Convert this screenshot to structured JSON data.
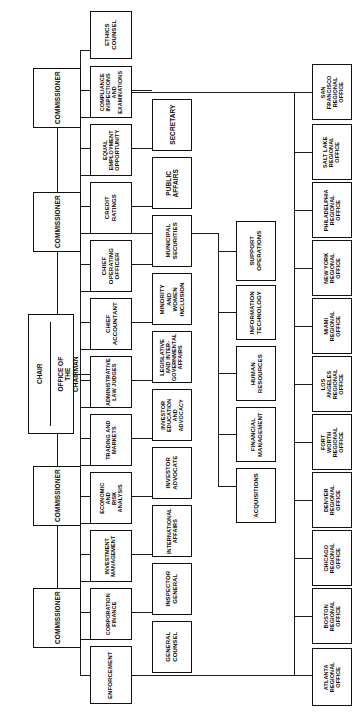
{
  "chart": {
    "orientation": "rotated-90",
    "line_color": "#1a1a1a",
    "box_border_color": "#111111",
    "background": "#ffffff"
  },
  "commission": {
    "chair": {
      "title": "CHAIR",
      "office": "OFFICE OF THE\nCHAIRMAN"
    },
    "members": [
      {
        "label": "COMMISSIONER"
      },
      {
        "label": "COMMISSIONER"
      },
      {
        "label": "COMMISSIONER"
      },
      {
        "label": "COMMISSIONER"
      }
    ]
  },
  "ethics": {
    "label": "ETHICS\nCOUNSEL"
  },
  "divisions_column": [
    {
      "label": "COMPLIANCE\nINSPECTIONS\nAND\nEXAMINATIONS"
    },
    {
      "label": "EQUAL\nEMPLOYMENT\nOPPORTUNITY"
    },
    {
      "label": "CREDIT\nRATINGS"
    },
    {
      "label": "CHIEF\nOPERATING\nOFFICER"
    },
    {
      "label": "CHIEF\nACCOUNTANT"
    },
    {
      "label": "ADMINISTRATIVE\nLAW JUDGES"
    },
    {
      "label": "TRADING AND\nMARKETS"
    },
    {
      "label": "ECONOMIC AND\nRISK ANALYSIS"
    },
    {
      "label": "INVESTMENT\nMANAGEMENT"
    },
    {
      "label": "CORPORATION\nFINANCE"
    },
    {
      "label": "ENFORCEMENT"
    }
  ],
  "offices_column": [
    {
      "label": "SECRETARY"
    },
    {
      "label": "PUBLIC\nAFFAIRS"
    },
    {
      "label": "MUNICIPAL\nSECURITIES"
    },
    {
      "label": "MINORITY\nAND WOMEN\nINCLUSION"
    },
    {
      "label": "LEGISLATIVE\nAND INTER-\nGOVERNMENTAL\nAFFAIRS"
    },
    {
      "label": "INVESTOR\nEDUCATION\nAND ADVOCACY"
    },
    {
      "label": "INVESTOR\nADVOCATE"
    },
    {
      "label": "INTERNATIONAL\nAFFAIRS"
    },
    {
      "label": "INSPECTOR\nGENERAL"
    },
    {
      "label": "GENERAL\nCOUNSEL"
    }
  ],
  "operations_column": [
    {
      "label": "SUPPORT\nOPERATIONS"
    },
    {
      "label": "INFORMATION\nTECHNOLOGY"
    },
    {
      "label": "HUMAN\nRESOURCES"
    },
    {
      "label": "FINANCIAL\nMANAGEMENT"
    },
    {
      "label": "ACQUISITIONS"
    }
  ],
  "regional_offices": [
    {
      "label": "SAN FRANCISCO\nREGIONAL\nOFFICE"
    },
    {
      "label": "SALT LAKE\nREGIONAL\nOFFICE"
    },
    {
      "label": "PHILADELPHIA\nREGIONAL\nOFFICE"
    },
    {
      "label": "NEW YORK\nREGIONAL\nOFFICE"
    },
    {
      "label": "MIAMI\nREGIONAL\nOFFICE"
    },
    {
      "label": "LOS ANGELES\nREGIONAL\nOFFICE"
    },
    {
      "label": "FORT WORTH\nREGIONAL\nOFFICE"
    },
    {
      "label": "DENVER\nREGIONAL\nOFFICE"
    },
    {
      "label": "CHICAGO\nREGIONAL\nOFFICE"
    },
    {
      "label": "BOSTON\nREGIONAL\nOFFICE"
    },
    {
      "label": "ATLANTA\nREGIONAL\nOFFICE"
    }
  ]
}
